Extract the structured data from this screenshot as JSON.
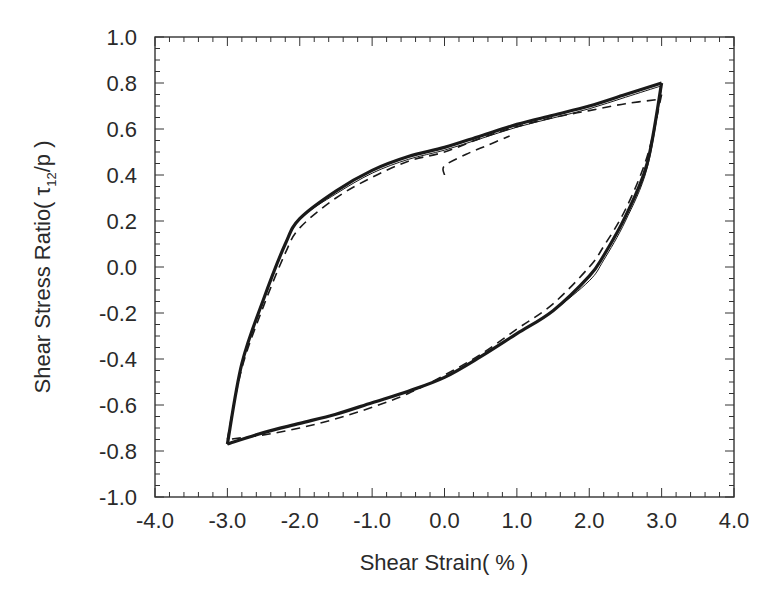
{
  "chart_data": {
    "type": "line",
    "title": "",
    "xlabel": "Shear Strain( % )",
    "ylabel_parts": {
      "prefix": "Shear Stress Ratio( ",
      "symbol": "τ",
      "subscript": "12",
      "suffix": "/p )"
    },
    "ylabel": "Shear Stress Ratio( τ12/p )",
    "xlim": [
      -4.0,
      4.0
    ],
    "ylim": [
      -1.0,
      1.0
    ],
    "x_ticks": [
      "-4.0",
      "-3.0",
      "-2.0",
      "-1.0",
      "0.0",
      "1.0",
      "2.0",
      "3.0",
      "4.0"
    ],
    "y_ticks": [
      "1.0",
      "0.8",
      "0.6",
      "0.4",
      "0.2",
      "0.0",
      "-0.2",
      "-0.4",
      "-0.6",
      "-0.8",
      "-1.0"
    ],
    "x_minor_step": 0.2,
    "y_minor_step": 0.05,
    "grid": false,
    "legend": null,
    "series": [
      {
        "name": "Experiment / model loop (solid, thick)",
        "style": "solid",
        "upper_branch": {
          "x": [
            -3.0,
            -2.8,
            -2.5,
            -2.2,
            -2.0,
            -1.5,
            -1.0,
            -0.5,
            0.0,
            0.5,
            1.0,
            1.5,
            2.0,
            2.5,
            3.0
          ],
          "y": [
            -0.77,
            -0.42,
            -0.14,
            0.1,
            0.21,
            0.33,
            0.42,
            0.48,
            0.52,
            0.57,
            0.62,
            0.66,
            0.7,
            0.75,
            0.8
          ]
        },
        "lower_branch": {
          "x": [
            3.0,
            2.8,
            2.5,
            2.2,
            2.0,
            1.5,
            1.0,
            0.5,
            0.0,
            -0.5,
            -1.0,
            -1.5,
            -2.0,
            -2.5,
            -3.0
          ],
          "y": [
            0.8,
            0.45,
            0.22,
            0.05,
            -0.04,
            -0.19,
            -0.29,
            -0.39,
            -0.48,
            -0.54,
            -0.59,
            -0.64,
            -0.68,
            -0.72,
            -0.77
          ]
        }
      },
      {
        "name": "Comparison loop (dashed)",
        "style": "dashed",
        "upper_branch": {
          "x": [
            -3.0,
            -2.8,
            -2.5,
            -2.2,
            -2.0,
            -1.5,
            -1.0,
            -0.5,
            0.0,
            0.5,
            1.0,
            1.5,
            2.0,
            2.5,
            3.0
          ],
          "y": [
            -0.75,
            -0.44,
            -0.17,
            0.06,
            0.17,
            0.3,
            0.39,
            0.46,
            0.5,
            0.56,
            0.61,
            0.65,
            0.68,
            0.71,
            0.73
          ]
        },
        "lower_branch": {
          "x": [
            3.0,
            2.8,
            2.5,
            2.2,
            2.0,
            1.5,
            1.0,
            0.5,
            0.0,
            -0.5,
            -1.0,
            -1.5,
            -2.0,
            -2.5,
            -3.0
          ],
          "y": [
            0.75,
            0.48,
            0.25,
            0.09,
            0.0,
            -0.16,
            -0.27,
            -0.38,
            -0.47,
            -0.55,
            -0.61,
            -0.66,
            -0.7,
            -0.73,
            -0.75
          ]
        },
        "initial_loading": {
          "x": [
            0.0,
            0.0,
            0.3,
            0.6,
            0.9
          ],
          "y": [
            0.4,
            0.44,
            0.49,
            0.53,
            0.57
          ]
        }
      }
    ]
  }
}
